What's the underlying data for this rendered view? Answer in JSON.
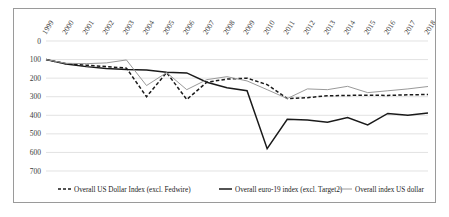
{
  "chart_data": {
    "type": "line",
    "title": "",
    "xlabel": "",
    "ylabel": "",
    "grid": true,
    "legend_position": "bottom",
    "y_axis_inverted": true,
    "ylim": [
      0,
      700
    ],
    "yticks": [
      0,
      100,
      200,
      300,
      400,
      500,
      600,
      700
    ],
    "ytick_labels": [
      "0",
      "100",
      "200",
      "300",
      "400",
      "500",
      "600",
      "700"
    ],
    "categories": [
      "1999",
      "2000",
      "2001",
      "2002",
      "2003",
      "2004",
      "2005",
      "2006",
      "2007",
      "2008",
      "2009",
      "2010",
      "2011",
      "2012",
      "2013",
      "2014",
      "2015",
      "2016",
      "2017",
      "2018"
    ],
    "series": [
      {
        "name": "Overall US Dollar Index (excl. Fedwire)",
        "style": "dashed",
        "color": "#1a1a1a",
        "width": 1.5,
        "values": [
          100,
          122,
          130,
          138,
          146,
          300,
          170,
          315,
          222,
          205,
          200,
          235,
          310,
          305,
          295,
          293,
          292,
          293,
          290,
          288
        ]
      },
      {
        "name": "Overall euro-19 index (excl. Target2)",
        "style": "solid",
        "color": "#1a1a1a",
        "width": 1.5,
        "values": [
          100,
          124,
          138,
          148,
          154,
          156,
          168,
          172,
          222,
          252,
          268,
          580,
          422,
          425,
          437,
          412,
          452,
          390,
          400,
          388
        ]
      },
      {
        "name": "Overall index US dollar",
        "style": "solid",
        "color": "#9a9a9a",
        "width": 1.0,
        "values": [
          100,
          120,
          122,
          118,
          102,
          240,
          170,
          262,
          208,
          192,
          215,
          262,
          310,
          258,
          262,
          244,
          278,
          268,
          258,
          245
        ]
      }
    ]
  },
  "legend": {
    "items": [
      {
        "label": "Overall US Dollar Index (excl. Fedwire)",
        "style": "dashed",
        "color": "#1a1a1a"
      },
      {
        "label": "Overall euro-19 index (excl. Target2)",
        "style": "solid",
        "color": "#1a1a1a"
      },
      {
        "label": "Overall index US dollar",
        "style": "solid",
        "color": "#9a9a9a"
      }
    ]
  }
}
